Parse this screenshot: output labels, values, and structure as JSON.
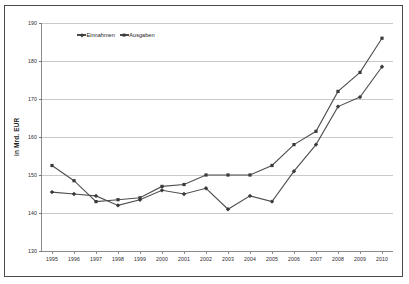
{
  "chart_data": {
    "type": "line",
    "title": "",
    "xlabel": "",
    "ylabel": "in Mrd. EUR",
    "ylim": [
      130,
      190
    ],
    "ytick_values": [
      190,
      180,
      170,
      160,
      150,
      140,
      130
    ],
    "ytick_labels": [
      "190",
      "180",
      "170",
      "160",
      "150",
      "140",
      "130"
    ],
    "grid": true,
    "legend_position": "top-left inside plot",
    "categories": [
      "1995",
      "1996",
      "1997",
      "1998",
      "1999",
      "2000",
      "2001",
      "2002",
      "2003",
      "2004",
      "2005",
      "2006",
      "2007",
      "2008",
      "2009",
      "2010"
    ],
    "series": [
      {
        "name": "Einnahmen",
        "marker": "diamond",
        "color": "#4f4f4f",
        "values": [
          145.5,
          145.0,
          144.5,
          142.0,
          143.5,
          146.0,
          145.0,
          146.5,
          141.0,
          144.5,
          143.0,
          151.0,
          158.0,
          168.0,
          170.5,
          178.5
        ]
      },
      {
        "name": "Ausgaben",
        "marker": "square",
        "color": "#4f4f4f",
        "values": [
          152.5,
          148.5,
          143.0,
          143.5,
          144.0,
          147.0,
          147.5,
          150.0,
          150.0,
          150.0,
          152.5,
          158.0,
          161.5,
          172.0,
          177.0,
          186.0
        ]
      }
    ]
  },
  "legend": {
    "entries": [
      {
        "label": "Einnahmen",
        "marker": "diamond"
      },
      {
        "label": "Ausgaben",
        "marker": "square"
      }
    ]
  }
}
